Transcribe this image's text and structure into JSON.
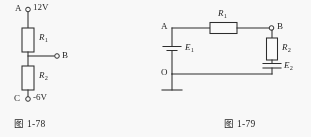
{
  "page": {
    "background_color": "#fdfdfd",
    "ink_color": "#2a2a2a"
  },
  "figures": [
    {
      "id": "fig-1-78",
      "caption": "图 1-78",
      "type": "circuit-diagram",
      "description": "Series voltage divider between terminal A at 12V and terminal C at -6V with midpoint terminal B",
      "nodes": [
        {
          "name": "A",
          "label": "A",
          "potential": "12V"
        },
        {
          "name": "B",
          "label": "B",
          "potential": ""
        },
        {
          "name": "C",
          "label": "C",
          "potential": "-6V"
        }
      ],
      "components": [
        {
          "name": "R1",
          "label": "R",
          "subscript": "1",
          "kind": "resistor",
          "orientation": "vertical"
        },
        {
          "name": "R2",
          "label": "R",
          "subscript": "2",
          "kind": "resistor",
          "orientation": "vertical"
        }
      ]
    },
    {
      "id": "fig-1-79",
      "caption": "图 1-79",
      "type": "circuit-diagram",
      "description": "Loop with source E1 between node A and ground node O, resistor R1 from A to B, resistor R2 and source E2 from B back to O",
      "nodes": [
        {
          "name": "A",
          "label": "A",
          "potential": ""
        },
        {
          "name": "B",
          "label": "B",
          "potential": ""
        },
        {
          "name": "O",
          "label": "O",
          "potential": ""
        }
      ],
      "components": [
        {
          "name": "R1",
          "label": "R",
          "subscript": "1",
          "kind": "resistor",
          "orientation": "horizontal"
        },
        {
          "name": "R2",
          "label": "R",
          "subscript": "2",
          "kind": "resistor",
          "orientation": "vertical"
        },
        {
          "name": "E1",
          "label": "E",
          "subscript": "1",
          "kind": "battery",
          "orientation": "vertical"
        },
        {
          "name": "E2",
          "label": "E",
          "subscript": "2",
          "kind": "battery",
          "orientation": "vertical"
        },
        {
          "name": "ground",
          "label": "",
          "subscript": "",
          "kind": "ground",
          "orientation": "vertical"
        }
      ]
    }
  ]
}
